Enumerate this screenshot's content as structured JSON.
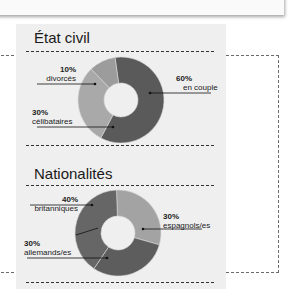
{
  "chart_data": [
    {
      "type": "pie",
      "variant": "donut",
      "title": "État civil",
      "slices": [
        {
          "label": "en couple",
          "value": 60,
          "display": "60%",
          "color": "#5a5a5a"
        },
        {
          "label": "célibataires",
          "value": 30,
          "display": "30%",
          "color": "#a9a9a9"
        },
        {
          "label": "divorcés",
          "value": 10,
          "display": "10%",
          "color": "#9c9c9c"
        }
      ]
    },
    {
      "type": "pie",
      "variant": "donut",
      "title": "Nationalités",
      "slices": [
        {
          "label": "espagnols/es",
          "value": 30,
          "display": "30%",
          "color": "#a3a3a3"
        },
        {
          "label": "allemands/es",
          "value": 30,
          "display": "30%",
          "color": "#5d5d5d"
        },
        {
          "label": "britanniques",
          "value": 40,
          "display": "40%",
          "color": "#666666"
        }
      ]
    }
  ]
}
